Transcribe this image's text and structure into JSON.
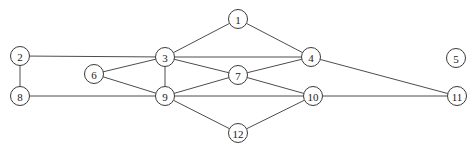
{
  "diagram": {
    "background_color": "#ffffff",
    "edge_color": "#4d4d4d",
    "node_fill_color": "#ffffff",
    "node_stroke_color": "#3a3a3a",
    "node_label_color": "#1a1a1a",
    "node_radius": 9.5,
    "width": 476,
    "height": 152
  },
  "chart_data": {
    "type": "diagram",
    "layout": "node-link",
    "directed": false,
    "node_count": 12,
    "edge_count": 18,
    "nodes": [
      {
        "id": "1",
        "label": "1",
        "x": 238,
        "y": 19
      },
      {
        "id": "2",
        "label": "2",
        "x": 20,
        "y": 56
      },
      {
        "id": "3",
        "label": "3",
        "x": 165,
        "y": 57
      },
      {
        "id": "4",
        "label": "4",
        "x": 311,
        "y": 57
      },
      {
        "id": "5",
        "label": "5",
        "x": 456,
        "y": 58
      },
      {
        "id": "6",
        "label": "6",
        "x": 94,
        "y": 74
      },
      {
        "id": "7",
        "label": "7",
        "x": 238,
        "y": 75
      },
      {
        "id": "8",
        "label": "8",
        "x": 20,
        "y": 96
      },
      {
        "id": "9",
        "label": "9",
        "x": 165,
        "y": 96
      },
      {
        "id": "10",
        "label": "10",
        "x": 313,
        "y": 96
      },
      {
        "id": "11",
        "label": "11",
        "x": 457,
        "y": 96
      },
      {
        "id": "12",
        "label": "12",
        "x": 238,
        "y": 133
      }
    ],
    "edges": [
      {
        "source": "1",
        "target": "3"
      },
      {
        "source": "1",
        "target": "4"
      },
      {
        "source": "2",
        "target": "3"
      },
      {
        "source": "2",
        "target": "8"
      },
      {
        "source": "3",
        "target": "4"
      },
      {
        "source": "3",
        "target": "6"
      },
      {
        "source": "3",
        "target": "7"
      },
      {
        "source": "3",
        "target": "9"
      },
      {
        "source": "4",
        "target": "7"
      },
      {
        "source": "4",
        "target": "11"
      },
      {
        "source": "6",
        "target": "9"
      },
      {
        "source": "7",
        "target": "9"
      },
      {
        "source": "7",
        "target": "10"
      },
      {
        "source": "8",
        "target": "9"
      },
      {
        "source": "9",
        "target": "10"
      },
      {
        "source": "9",
        "target": "12"
      },
      {
        "source": "10",
        "target": "11"
      },
      {
        "source": "10",
        "target": "12"
      }
    ],
    "isolated_nodes": [
      "5"
    ]
  }
}
